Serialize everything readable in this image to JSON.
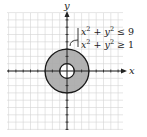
{
  "diagram": {
    "type": "region-plot",
    "axes": {
      "x_label": "x",
      "y_label": "y"
    },
    "grid": {
      "on": true,
      "range": [
        -8,
        8
      ],
      "step": 1
    },
    "region": {
      "description": "annulus between circles of radius 1 and 3 centered at origin, shaded",
      "outer_radius": 3,
      "inner_radius": 1,
      "fill": "#a9a9a9",
      "stroke": "#1a1a1a"
    },
    "inequalities": [
      {
        "lhs": "x",
        "lhs_exp": "2",
        "mid": " + y",
        "mid_exp": "2",
        "rel": " ≤ 9"
      },
      {
        "lhs": "x",
        "lhs_exp": "2",
        "mid": " + y",
        "mid_exp": "2",
        "rel": " ≥ 1"
      }
    ],
    "colors": {
      "grid": "#d4d4d4",
      "axis": "#222222",
      "background": "#ffffff"
    }
  }
}
